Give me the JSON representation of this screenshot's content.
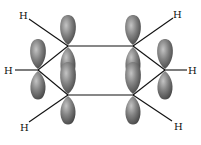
{
  "diagram": {
    "atom_labels": {
      "h_top_left": "H",
      "h_top_right": "H",
      "h_left": "H",
      "h_right": "H",
      "h_bottom_left": "H",
      "h_bottom_right": "H"
    },
    "colors": {
      "lobe_dark": "#4a4a4a",
      "lobe_mid": "#7a7a7a",
      "lobe_light": "#b5b5b5",
      "bond": "#111111"
    },
    "carbons": [
      {
        "id": "c_top_left",
        "x": 68,
        "y": 46
      },
      {
        "id": "c_top_right",
        "x": 133,
        "y": 46
      },
      {
        "id": "c_right",
        "x": 165,
        "y": 70
      },
      {
        "id": "c_bottom_right",
        "x": 133,
        "y": 95
      },
      {
        "id": "c_bottom_left",
        "x": 68,
        "y": 95
      },
      {
        "id": "c_left",
        "x": 38,
        "y": 70
      }
    ]
  }
}
